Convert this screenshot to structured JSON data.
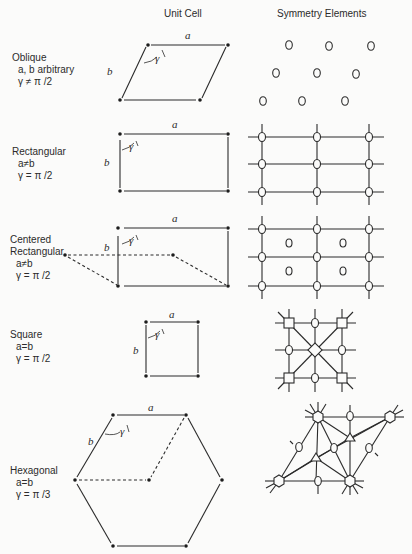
{
  "headers": {
    "unit_cell": "Unit Cell",
    "symmetry_elements": "Symmetry Elements"
  },
  "lattices": [
    {
      "name": "Oblique",
      "condition1": "a, b arbitrary",
      "condition2": "γ ≠ π /2"
    },
    {
      "name": "Rectangular",
      "condition1": "a≠b",
      "condition2": "γ = π /2"
    },
    {
      "name": "Centered",
      "name2": "Rectangular",
      "condition1": "a≠b",
      "condition2": "γ = π /2"
    },
    {
      "name": "Square",
      "condition1": "a=b",
      "condition2": "γ = π /2"
    },
    {
      "name": "Hexagonal",
      "condition1": "a=b",
      "condition2": "γ = π /3"
    }
  ],
  "symbols": {
    "a": "a",
    "b": "b",
    "gamma": "γ"
  },
  "colors": {
    "ink": "#2b2b2b",
    "background": "#fbfbfa"
  }
}
